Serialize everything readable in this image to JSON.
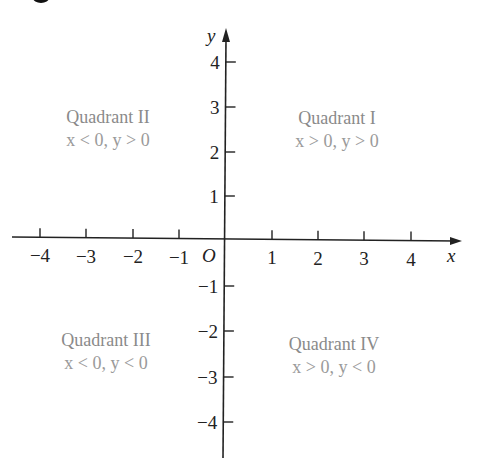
{
  "diagram": {
    "type": "coordinate-plane",
    "x_axis": {
      "label": "x",
      "ticks": [
        {
          "label": "−4",
          "x": 40
        },
        {
          "label": "−3",
          "x": 86
        },
        {
          "label": "−2",
          "x": 133
        },
        {
          "label": "−1",
          "x": 179
        },
        {
          "label": "1",
          "x": 272
        },
        {
          "label": "2",
          "x": 318
        },
        {
          "label": "3",
          "x": 364
        },
        {
          "label": "4",
          "x": 411
        }
      ]
    },
    "y_axis": {
      "label": "y",
      "ticks": [
        {
          "label": "4",
          "y": 62
        },
        {
          "label": "3",
          "y": 107
        },
        {
          "label": "2",
          "y": 152
        },
        {
          "label": "1",
          "y": 196
        },
        {
          "label": "−1",
          "y": 286
        },
        {
          "label": "−2",
          "y": 331
        },
        {
          "label": "−3",
          "y": 377
        },
        {
          "label": "−4",
          "y": 422
        }
      ]
    },
    "origin_label": "O",
    "quadrants": [
      {
        "id": "I",
        "title": "Quadrant I",
        "condition": "x > 0, y > 0"
      },
      {
        "id": "II",
        "title": "Quadrant II",
        "condition": "x < 0, y > 0"
      },
      {
        "id": "III",
        "title": "Quadrant III",
        "condition": "x < 0, y < 0"
      },
      {
        "id": "IV",
        "title": "Quadrant IV",
        "condition": "x > 0, y < 0"
      }
    ],
    "colors": {
      "axis": "#222222",
      "quadrant_text": "#8a8a8a",
      "background": "#ffffff"
    }
  }
}
